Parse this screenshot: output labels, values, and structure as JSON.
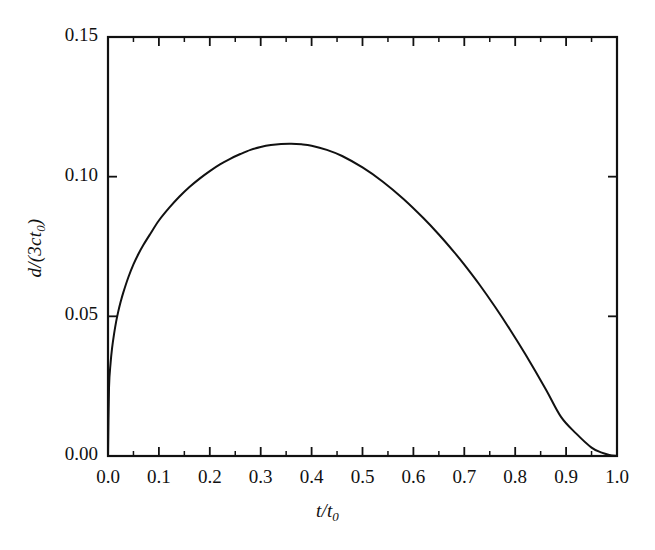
{
  "chart_data": {
    "type": "line",
    "title": "",
    "subtitle": "",
    "xlabel": "t/t0",
    "xlabel_main": "t/t",
    "xlabel_sub": "0",
    "ylabel": "d/(3ct0)",
    "ylabel_num": "d",
    "ylabel_den": "/(3ct",
    "ylabel_sub": "0",
    "ylabel_close": ")",
    "xlim": [
      0.0,
      1.0
    ],
    "ylim": [
      0.0,
      0.15
    ],
    "grid": false,
    "legend": null,
    "xticks": [
      0.0,
      0.1,
      0.2,
      0.3,
      0.4,
      0.5,
      0.6,
      0.7,
      0.8,
      0.9,
      1.0
    ],
    "xtick_labels": [
      "0.0",
      "0.1",
      "0.2",
      "0.3",
      "0.4",
      "0.5",
      "0.6",
      "0.7",
      "0.8",
      "0.9",
      "1.0"
    ],
    "xminor_step": 0.05,
    "yticks": [
      0.0,
      0.05,
      0.1,
      0.15
    ],
    "ytick_labels": [
      "0.00",
      "0.05",
      "0.10",
      "0.15"
    ],
    "yminor_step": 0.025,
    "tick_direction": "in",
    "line_color": "#111111",
    "line_width": 2.0,
    "frame_color": "#111111",
    "background": "#ffffff",
    "peak": {
      "x": 0.3,
      "y": 0.148
    },
    "x": [
      0.0,
      0.002,
      0.005,
      0.008,
      0.012,
      0.016,
      0.02,
      0.025,
      0.03,
      0.04,
      0.05,
      0.06,
      0.07,
      0.083,
      0.1,
      0.12,
      0.14,
      0.16,
      0.18,
      0.2,
      0.22,
      0.24,
      0.26,
      0.28,
      0.3,
      0.32,
      0.34,
      0.36,
      0.38,
      0.4,
      0.43,
      0.46,
      0.5,
      0.54,
      0.58,
      0.62,
      0.65,
      0.68,
      0.7,
      0.73,
      0.76,
      0.79,
      0.82,
      0.86,
      0.89,
      0.92,
      0.95,
      0.97,
      0.985,
      1.0
    ],
    "y": [
      0.0,
      0.0245,
      0.0331,
      0.0386,
      0.0438,
      0.0481,
      0.0516,
      0.0553,
      0.0585,
      0.064,
      0.0686,
      0.0724,
      0.0757,
      0.0795,
      0.0843,
      0.0888,
      0.0928,
      0.0963,
      0.0993,
      0.102,
      0.1044,
      0.1064,
      0.1081,
      0.1096,
      0.1106,
      0.1113,
      0.1117,
      0.1118,
      0.1116,
      0.1111,
      0.1096,
      0.1074,
      0.1033,
      0.0982,
      0.0921,
      0.0851,
      0.0793,
      0.073,
      0.0685,
      0.0613,
      0.0535,
      0.0452,
      0.0364,
      0.0239,
      0.014,
      0.008,
      0.003,
      0.0012,
      0.0004,
      0.0
    ],
    "curve_note": "single smooth curve rising steeply from origin, peak 0.148 near t/t0 = 0.30, decaying to zero at t/t0 = 1.00"
  }
}
